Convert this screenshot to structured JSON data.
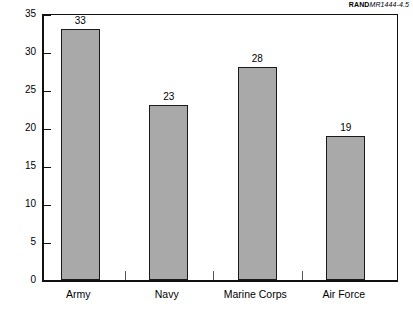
{
  "credit": {
    "brand": "RAND",
    "document_id": "MR1444-4.5"
  },
  "chart_data": {
    "type": "bar",
    "title": "",
    "xlabel": "",
    "ylabel": "",
    "categories": [
      "Army",
      "Navy",
      "Marine Corps",
      "Air Force"
    ],
    "values": [
      33,
      23,
      28,
      19
    ],
    "value_labels": [
      "33",
      "23",
      "28",
      "19"
    ],
    "ylim": [
      0,
      35
    ],
    "ytick_step": 5,
    "ytick_labels": [
      "0",
      "5",
      "10",
      "15",
      "20",
      "25",
      "30",
      "35"
    ],
    "ytick_values": [
      0,
      5,
      10,
      15,
      20,
      25,
      30,
      35
    ],
    "grid": false,
    "legend": null,
    "bar_color": "#a9a9a9",
    "bar_border_color": "#1a1a1a",
    "axis_color": "#111111",
    "background": "#ffffff"
  }
}
